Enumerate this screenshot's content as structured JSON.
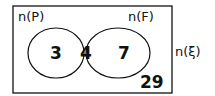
{
  "diagram": {
    "type": "venn",
    "universal_label": "n(ξ)",
    "sets": [
      {
        "name": "P",
        "label": "n(P)",
        "only": "3"
      },
      {
        "name": "F",
        "label": "n(F)",
        "only": "7"
      }
    ],
    "intersection": "4",
    "outside": "29",
    "colors": {
      "stroke": "#111111",
      "background": "#ffffff"
    }
  }
}
